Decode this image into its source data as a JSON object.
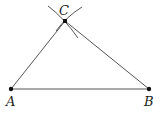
{
  "diagram": {
    "points": [
      {
        "id": "A",
        "label": "A",
        "x": 11,
        "y": 89,
        "label_x": 6,
        "label_y": 106
      },
      {
        "id": "B",
        "label": "B",
        "x": 149,
        "y": 89,
        "label_x": 144,
        "label_y": 106
      },
      {
        "id": "C",
        "label": "C",
        "x": 65,
        "y": 21,
        "label_x": 59,
        "label_y": 15
      }
    ],
    "segments": [
      {
        "from": "A",
        "to": "B"
      },
      {
        "from": "A",
        "to": "C"
      },
      {
        "from": "B",
        "to": "C"
      }
    ],
    "arcs": [
      {
        "name": "arc-from-A",
        "center": "A"
      },
      {
        "name": "arc-from-B",
        "center": "B"
      }
    ],
    "colors": {
      "line": "#555555",
      "point": "#111111",
      "label": "#222222",
      "background": "#ffffff"
    }
  }
}
